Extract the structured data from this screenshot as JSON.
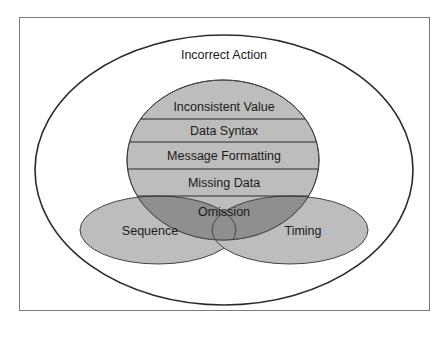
{
  "diagram": {
    "outer_label": "Incorrect Action",
    "stack_labels": [
      "Inconsistent Value",
      "Data Syntax",
      "Message Formatting",
      "Missing Data"
    ],
    "center_label": "Omission",
    "left_label": "Sequence",
    "right_label": "Timing",
    "colors": {
      "frame": "#7a7a7a",
      "stroke": "#2a2a2a",
      "light_fill": "#bdbdbd",
      "dark_fill": "#8f8f8f",
      "background": "#ffffff"
    }
  }
}
